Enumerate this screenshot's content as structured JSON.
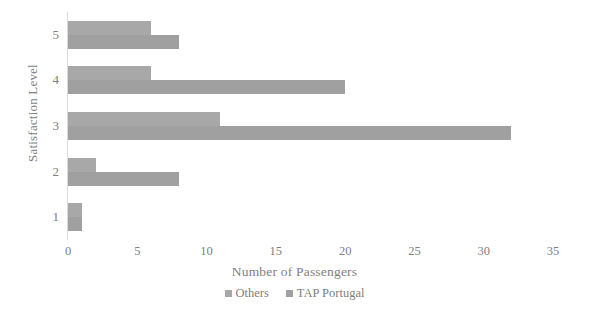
{
  "chart_data": {
    "type": "bar",
    "orientation": "horizontal",
    "title": "",
    "xlabel": "Number of Passengers",
    "ylabel": "Satisfaction Level",
    "categories": [
      "1",
      "2",
      "3",
      "4",
      "5"
    ],
    "xlim": [
      0,
      35
    ],
    "xticks": [
      0,
      5,
      10,
      15,
      20,
      25,
      30,
      35
    ],
    "grid": false,
    "legend_position": "bottom",
    "series": [
      {
        "name": "Others",
        "color": "#a8a8a8",
        "values": [
          1,
          2,
          11,
          6,
          6
        ]
      },
      {
        "name": "TAP Portugal",
        "color": "#a0a0a0",
        "values": [
          1,
          8,
          32,
          20,
          8
        ]
      }
    ]
  },
  "axes": {
    "y_title": "Satisfaction Level",
    "x_title": "Number of Passengers",
    "y_tick_labels": [
      "5",
      "4",
      "3",
      "2",
      "1"
    ],
    "x_tick_labels": [
      "0",
      "5",
      "10",
      "15",
      "20",
      "25",
      "30",
      "35"
    ]
  },
  "legend": {
    "items": [
      {
        "label": "Others",
        "color": "#a8a8a8"
      },
      {
        "label": "TAP Portugal",
        "color": "#a0a0a0"
      }
    ]
  }
}
